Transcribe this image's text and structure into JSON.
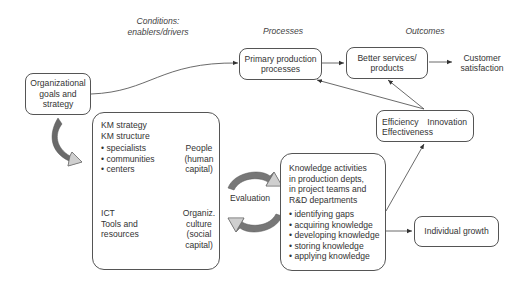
{
  "headers": {
    "conditions": "Conditions:\nenablers/drivers",
    "processes": "Processes",
    "outcomes": "Outcomes"
  },
  "nodes": {
    "org_goals": "Organizational\ngoals and\nstrategy",
    "primary_production": "Primary production\nprocesses",
    "better_services": "Better services/\nproducts",
    "customer_satisfaction": "Customer\nsatisfaction",
    "efficiency": "Efficiency",
    "innovation": "Innovation",
    "effectiveness": "Effectiveness",
    "individual_growth": "Individual growth",
    "evaluation": "Evaluation"
  },
  "km_box": {
    "title": "KM strategy\nKM structure",
    "items": [
      "specialists",
      "communities",
      "centers"
    ],
    "people": "People\n(human\ncapital)",
    "ict": "ICT\nTools and\nresources",
    "culture": "Organiz.\nculture\n(social\ncapital)"
  },
  "knowledge_box": {
    "title": "Knowledge activities\nin production depts,\nin project teams and\nR&D departments",
    "items": [
      "identifying gaps",
      "acquiring knowledge",
      "developing knowledge",
      "storing knowledge",
      "applying knowledge"
    ]
  },
  "colors": {
    "line": "#444444",
    "box_border": "#555555",
    "arrow_dark": "#6a6a6a",
    "arrow_light": "#c8c8c8"
  }
}
